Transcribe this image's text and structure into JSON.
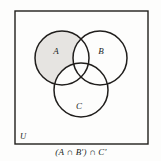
{
  "figure": {
    "name": "venn-diagram-three-sets",
    "universe_label": "U",
    "caption": "(A ∩ B′) ∩ C′",
    "background_color": "#fdfdfc",
    "stroke_color": "#201e1c",
    "shade_color": "#e6e4e1",
    "sets": [
      {
        "id": "A",
        "label": "A",
        "cx": 62,
        "cy": 58,
        "r": 27,
        "shaded": true
      },
      {
        "id": "B",
        "label": "B",
        "cx": 100,
        "cy": 58,
        "r": 27,
        "shaded": false
      },
      {
        "id": "C",
        "label": "C",
        "cx": 81,
        "cy": 90,
        "r": 27,
        "shaded": false
      }
    ],
    "label_positions": {
      "A": {
        "x": 56,
        "y": 54
      },
      "B": {
        "x": 101,
        "y": 54
      },
      "C": {
        "x": 79,
        "y": 109
      },
      "U": {
        "x": 20,
        "y": 139
      }
    },
    "frame": {
      "x": 15,
      "y": 11,
      "width": 133,
      "height": 133
    },
    "caption_position": {
      "x": 81,
      "y": 155
    }
  },
  "chart_data": {
    "type": "diagram",
    "title": "(A ∩ B′) ∩ C′",
    "shaded_region_description": "A only — inside A, outside B, outside C",
    "categories": [
      "A",
      "B",
      "C"
    ],
    "values": [
      1,
      0,
      0
    ]
  }
}
